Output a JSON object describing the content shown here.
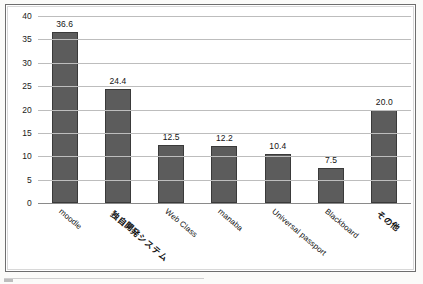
{
  "chart_data": {
    "type": "bar",
    "title": "",
    "xlabel": "",
    "ylabel": "",
    "ylim": [
      0,
      40
    ],
    "yticks": [
      40,
      35,
      30,
      25,
      20,
      15,
      10,
      5,
      0
    ],
    "grid": true,
    "legend": "none",
    "categories": [
      "moodle",
      "独自開発システム",
      "Web Class",
      "manaba",
      "Universal passport",
      "Blackboard",
      "その他"
    ],
    "values": [
      36.6,
      24.4,
      12.5,
      12.2,
      10.4,
      7.5,
      20.0
    ],
    "data_labels": [
      "36.6",
      "24.4",
      "12.5",
      "12.2",
      "10.4",
      "7.5",
      "20.0"
    ],
    "bar_color": "#5c5c5c",
    "bar_border_color": "#3a3a3a",
    "gridline_color": "#bdbdbd",
    "axis_color": "#8a8a8a",
    "background_color": "#ffffff"
  }
}
